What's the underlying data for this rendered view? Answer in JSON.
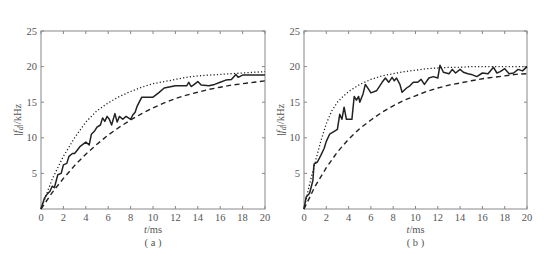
{
  "chart_data": [
    {
      "type": "line",
      "panel": "(a)",
      "xlabel": "t/ms",
      "ylabel": "|f_d|/kHz",
      "xlim": [
        0,
        20
      ],
      "ylim": [
        0,
        25
      ],
      "xticks": [
        0,
        2,
        4,
        6,
        8,
        10,
        12,
        14,
        16,
        18,
        20
      ],
      "yticks": [
        5,
        10,
        15,
        20,
        25
      ],
      "grid": false,
      "series": [
        {
          "name": "measured",
          "style": "solid",
          "x": [
            0,
            0.3,
            0.5,
            0.8,
            1,
            1.2,
            1.5,
            1.8,
            2,
            2.3,
            2.5,
            2.8,
            3,
            3.3,
            3.5,
            4,
            4.3,
            4.5,
            4.8,
            5,
            5.3,
            5.5,
            5.7,
            5.9,
            6.1,
            6.3,
            6.6,
            6.8,
            7,
            7.3,
            7.6,
            8,
            8.2,
            8.4,
            8.6,
            9,
            10,
            10.5,
            11,
            12,
            13,
            13.2,
            13.4,
            13.6,
            14,
            14.3,
            15,
            15.5,
            16,
            16.5,
            17,
            17.4,
            17.6,
            18,
            18.4,
            19,
            20
          ],
          "y": [
            0,
            1.5,
            2,
            2.5,
            3.2,
            3,
            4.8,
            5,
            6.2,
            6.4,
            7.4,
            7.8,
            7.8,
            8.4,
            8.8,
            9.4,
            9.0,
            10.5,
            11,
            11.5,
            11.8,
            12.8,
            12.3,
            13,
            12.6,
            11.8,
            13.4,
            12.2,
            13,
            12.6,
            13,
            12.6,
            13.2,
            13.6,
            14.5,
            15.7,
            15.7,
            16.3,
            17,
            17.3,
            17.3,
            17.8,
            17.2,
            17.4,
            17.9,
            17.4,
            17.3,
            17.5,
            17.8,
            18.1,
            18.2,
            18.9,
            18.5,
            18.8,
            18.8,
            18.8,
            18.8
          ]
        },
        {
          "name": "upper bound",
          "style": "dotted",
          "x": [
            0,
            1,
            2,
            3,
            4,
            5,
            6,
            7,
            8,
            9,
            10,
            11,
            12,
            13,
            14,
            15,
            16,
            17,
            18,
            19,
            20
          ],
          "y": [
            0,
            4.2,
            7.4,
            10,
            12.2,
            13.8,
            14.9,
            15.8,
            16.5,
            17.1,
            17.6,
            17.9,
            18.2,
            18.5,
            18.7,
            18.8,
            18.9,
            19.0,
            19.1,
            19.2,
            19.3
          ]
        },
        {
          "name": "lower bound",
          "style": "dashed",
          "x": [
            0,
            1,
            2,
            3,
            4,
            5,
            6,
            7,
            8,
            9,
            10,
            11,
            12,
            13,
            14,
            15,
            16,
            17,
            18,
            19,
            20
          ],
          "y": [
            0,
            2.3,
            4.3,
            6.1,
            7.7,
            9.1,
            10.4,
            11.5,
            12.5,
            13.4,
            14.2,
            14.9,
            15.5,
            16.0,
            16.4,
            16.8,
            17.1,
            17.4,
            17.6,
            17.8,
            18.0
          ]
        }
      ]
    },
    {
      "type": "line",
      "panel": "(b)",
      "xlabel": "t/ms",
      "ylabel": "|f_d|/kHz",
      "xlim": [
        0,
        20
      ],
      "ylim": [
        0,
        25
      ],
      "xticks": [
        0,
        2,
        4,
        6,
        8,
        10,
        12,
        14,
        16,
        18,
        20
      ],
      "yticks": [
        5,
        10,
        15,
        20,
        25
      ],
      "grid": false,
      "series": [
        {
          "name": "measured",
          "style": "solid",
          "x": [
            0,
            0.2,
            0.5,
            0.8,
            0.9,
            1.2,
            1.5,
            1.8,
            2,
            2.3,
            2.6,
            3,
            3.2,
            3.4,
            3.6,
            3.8,
            4,
            4.3,
            4.5,
            4.7,
            4.9,
            5,
            5.3,
            5.5,
            5.8,
            6,
            6.5,
            7,
            7.3,
            7.6,
            7.9,
            8.1,
            8.3,
            8.6,
            8.8,
            9.2,
            9.5,
            9.8,
            10.2,
            10.5,
            10.8,
            11.2,
            11.6,
            12,
            12.2,
            12.5,
            13,
            13.3,
            13.6,
            14,
            14.3,
            14.7,
            15,
            15.5,
            16,
            16.5,
            17,
            17.3,
            17.6,
            18,
            18.4,
            18.8,
            19.2,
            19.6,
            20
          ],
          "y": [
            0,
            1.7,
            2.2,
            4,
            6.3,
            6.6,
            7.5,
            8.5,
            9.5,
            10.5,
            10.8,
            11.2,
            13.3,
            12.6,
            14.3,
            12.6,
            12.6,
            12.6,
            15.8,
            15.3,
            15.8,
            15.0,
            16.2,
            17.5,
            16.8,
            16.3,
            16.6,
            17.8,
            18.4,
            17.8,
            18.5,
            18.0,
            18.4,
            17.5,
            16.4,
            17.0,
            17.3,
            17.8,
            17.8,
            18.2,
            17.5,
            18.4,
            18.6,
            18.4,
            20.2,
            19.2,
            19.0,
            19.6,
            19.1,
            19.6,
            19.2,
            19.0,
            18.9,
            18.6,
            19.1,
            19.0,
            19.9,
            19.1,
            19.3,
            19.7,
            19.0,
            19.1,
            19.6,
            19.4,
            20.0
          ]
        },
        {
          "name": "upper bound",
          "style": "dotted",
          "x": [
            0,
            0.5,
            1,
            1.5,
            2,
            2.5,
            3,
            3.5,
            4,
            5,
            6,
            7,
            8,
            9,
            10,
            11,
            12,
            13,
            14,
            15,
            16,
            17,
            18,
            19,
            20
          ],
          "y": [
            0,
            3.5,
            6.5,
            9.5,
            12,
            13.8,
            15.0,
            15.8,
            16.5,
            17.5,
            18.2,
            18.7,
            19.0,
            19.3,
            19.5,
            19.7,
            19.8,
            19.9,
            19.9,
            20.0,
            20.0,
            20.0,
            20.0,
            20.0,
            20.0
          ]
        },
        {
          "name": "lower bound",
          "style": "dashed",
          "x": [
            0,
            1,
            2,
            3,
            4,
            5,
            6,
            7,
            8,
            9,
            10,
            11,
            12,
            13,
            14,
            15,
            16,
            17,
            18,
            19,
            20
          ],
          "y": [
            0,
            3.2,
            5.8,
            8.0,
            9.8,
            11.3,
            12.5,
            13.6,
            14.5,
            15.3,
            15.9,
            16.5,
            17.0,
            17.4,
            17.7,
            18.0,
            18.3,
            18.5,
            18.7,
            18.9,
            19.0
          ]
        }
      ]
    }
  ],
  "panels": [
    {
      "label": "( a )",
      "xlabel_t": "t",
      "xlabel_unit": "/ms",
      "ylabel_text": "|f",
      "ylabel_sub": "d",
      "ylabel_unit": "|/kHz"
    },
    {
      "label": "( b )",
      "xlabel_t": "t",
      "xlabel_unit": "/ms",
      "ylabel_text": "|f",
      "ylabel_sub": "d",
      "ylabel_unit": "|/kHz"
    }
  ],
  "colors": {
    "axis": "#888888",
    "line": "#222222",
    "text": "#555555"
  }
}
